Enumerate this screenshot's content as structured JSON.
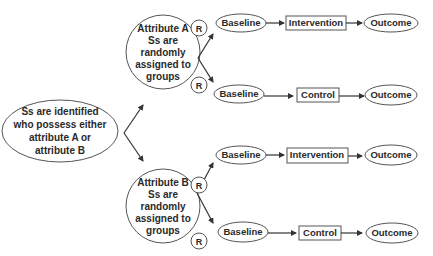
{
  "diagram": {
    "start": {
      "lines": [
        "Ss are identified",
        "who possess either",
        "attribute A or",
        "attribute B"
      ]
    },
    "groups": [
      {
        "lines": [
          "Attribute A",
          "Ss are",
          "randomly",
          "assigned to",
          "groups"
        ],
        "randomization_label": "R",
        "arms": [
          {
            "baseline": "Baseline",
            "condition": "Intervention",
            "outcome": "Outcome"
          },
          {
            "baseline": "Baseline",
            "condition": "Control",
            "outcome": "Outcome"
          }
        ]
      },
      {
        "lines": [
          "Attribute B",
          "Ss are",
          "randomly",
          "assigned to",
          "groups"
        ],
        "randomization_label": "R",
        "arms": [
          {
            "baseline": "Baseline",
            "condition": "Intervention",
            "outcome": "Outcome"
          },
          {
            "baseline": "Baseline",
            "condition": "Control",
            "outcome": "Outcome"
          }
        ]
      }
    ],
    "colors": {
      "stroke": "#555555",
      "text": "#2a2a2a",
      "background": "#ffffff"
    }
  }
}
